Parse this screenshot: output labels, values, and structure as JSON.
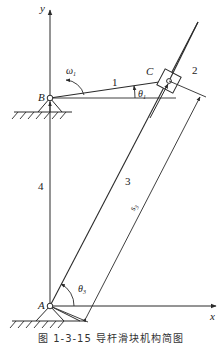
{
  "figure": {
    "caption": "图 1-3-15   导杆滑块机构简图",
    "axes": {
      "x_label": "x",
      "y_label": "y"
    },
    "points": {
      "A": "A",
      "B": "B",
      "C": "C"
    },
    "links": {
      "link1": "1",
      "link2": "2",
      "link3": "3",
      "link4": "4"
    },
    "angles": {
      "theta1": "θ",
      "theta1_sub": "1",
      "theta3": "θ",
      "theta3_sub": "3"
    },
    "angular_velocity": {
      "omega": "ω",
      "omega_sub": "1"
    },
    "dimension": {
      "s": "s",
      "s_sub": "3"
    },
    "colors": {
      "line": "#2a2a2a",
      "background": "#ffffff"
    }
  }
}
